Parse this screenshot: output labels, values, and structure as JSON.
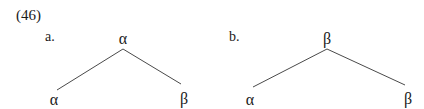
{
  "example_number": "(46)",
  "trees": [
    {
      "label": "a.",
      "root": "α",
      "children": [
        "α",
        "β"
      ]
    },
    {
      "label": "b.",
      "root": "β",
      "children": [
        "α",
        "β"
      ]
    }
  ],
  "colors": {
    "text": "#1a1a1a",
    "edge": "#4a4a4a",
    "background": "#ffffff"
  }
}
